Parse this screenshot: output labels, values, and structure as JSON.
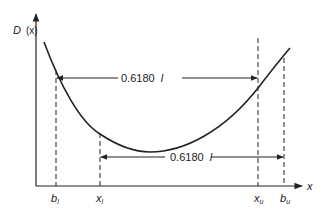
{
  "diagram": {
    "y_axis_label": "D (x)",
    "y_axis_label_main": "D",
    "y_axis_label_arg": "(x)",
    "x_axis_label": "x",
    "upper_interval": {
      "label_value": "0.6180",
      "label_var": "l",
      "from": "b_l",
      "to": "x_u"
    },
    "lower_interval": {
      "label_value": "0.6180",
      "label_var": "l",
      "from": "x_l",
      "to": "b_u"
    },
    "points": [
      {
        "id": "b_l",
        "main": "b",
        "sub": "l"
      },
      {
        "id": "x_l",
        "main": "x",
        "sub": "l"
      },
      {
        "id": "x_u",
        "main": "x",
        "sub": "u"
      },
      {
        "id": "b_u",
        "main": "b",
        "sub": "u"
      }
    ],
    "colors": {
      "line": "#222222",
      "background": "#ffffff"
    }
  }
}
